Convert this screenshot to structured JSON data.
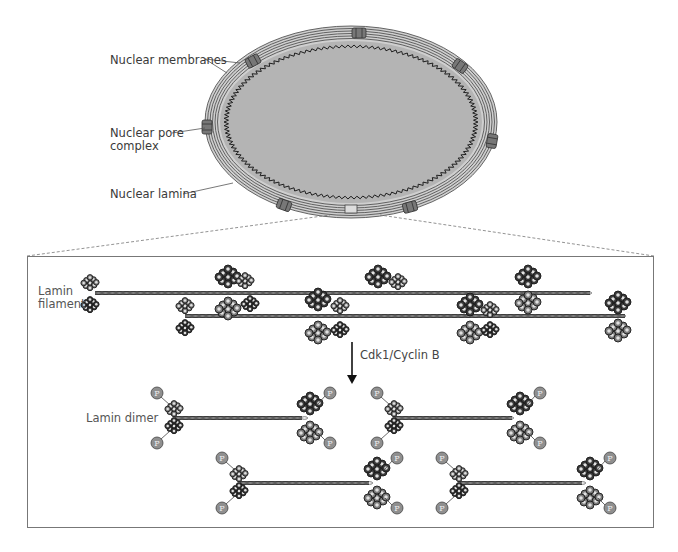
{
  "top_panel": {
    "title": "Nucleus",
    "labels": {
      "nuclear_membranes": "Nuclear membranes",
      "nuclear_pore_line1": "Nuclear pore",
      "nuclear_pore_line2": "complex",
      "nuclear_lamina": "Nuclear lamina"
    }
  },
  "bottom_panel": {
    "labels": {
      "lamin_filament_line1": "Lamin",
      "lamin_filament_line2": "filament",
      "arrow_label": "Cdk1/Cyclin B",
      "lamin_dimer": "Lamin dimer"
    },
    "phosphate_symbol": "P"
  },
  "colors": {
    "nucleoplasm": "#b4b4b4",
    "membrane": "#555555",
    "lamina": "#222222",
    "pore": "#6a6a6a",
    "coil_dark": "#3a3a3a",
    "coil_mid": "#7a7a7a",
    "coil_light": "#9a9a9a",
    "phosphate": "#8f8f8f",
    "box_border": "#777777"
  }
}
